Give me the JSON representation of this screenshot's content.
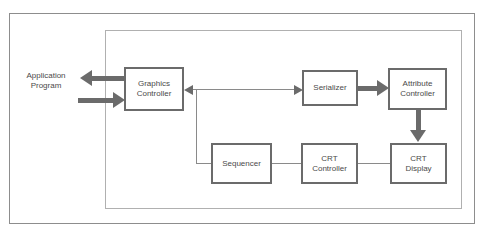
{
  "diagram": {
    "external_label": "Application\nProgram",
    "nodes": [
      {
        "id": "graphics-controller",
        "label": "Graphics\nController"
      },
      {
        "id": "serializer",
        "label": "Serializer"
      },
      {
        "id": "attribute-controller",
        "label": "Attribute\nController"
      },
      {
        "id": "sequencer",
        "label": "Sequencer"
      },
      {
        "id": "crt-controller",
        "label": "CRT\nController"
      },
      {
        "id": "crt-display",
        "label": "CRT\nDisplay"
      }
    ],
    "colors": {
      "box_border": "#6b6b6b",
      "thick_connector": "#6b6b6b",
      "thin_connector": "#8a8a8a",
      "outer_frame": "#8d8d8d",
      "inner_frame": "#b0b0b0",
      "text": "#4a4a4a",
      "background": "#ffffff"
    }
  }
}
